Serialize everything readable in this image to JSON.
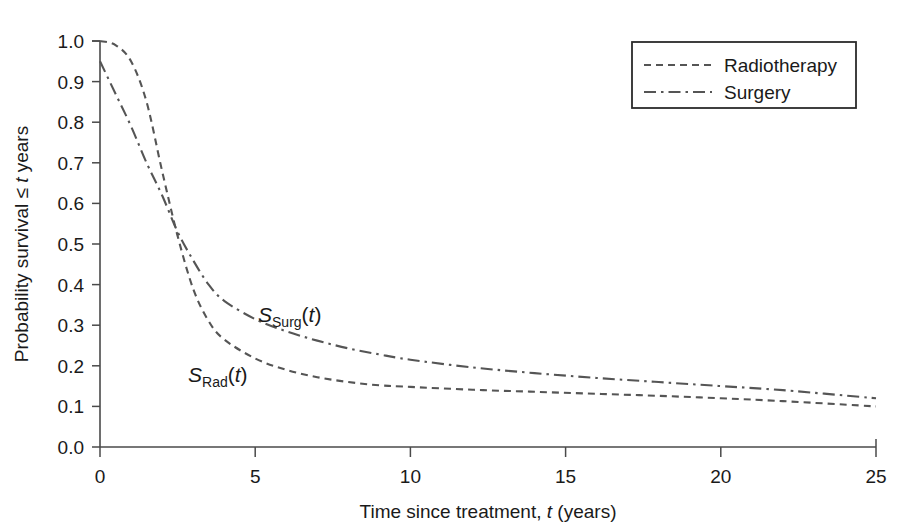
{
  "chart_data": {
    "type": "line",
    "title": "",
    "xlabel": "Time since treatment, t (years)",
    "ylabel": "Probability survival ≤ t years",
    "xlim": [
      0,
      25
    ],
    "ylim": [
      0,
      1
    ],
    "grid": false,
    "legend_position": "top-right",
    "x_ticks": [
      "0",
      "5",
      "10",
      "15",
      "20",
      "25"
    ],
    "x_tick_values": [
      0,
      5,
      10,
      15,
      20,
      25
    ],
    "y_ticks": [
      "0.0",
      "0.1",
      "0.2",
      "0.3",
      "0.4",
      "0.5",
      "0.6",
      "0.7",
      "0.8",
      "0.9",
      "1.0"
    ],
    "y_tick_values": [
      0.0,
      0.1,
      0.2,
      0.3,
      0.4,
      0.5,
      0.6,
      0.7,
      0.8,
      0.9,
      1.0
    ],
    "x": [
      0,
      0.5,
      1,
      1.5,
      2,
      2.5,
      3,
      3.5,
      4,
      5,
      6,
      7,
      8,
      9,
      10,
      12,
      14,
      16,
      18,
      20,
      22,
      25
    ],
    "series": [
      {
        "name": "Radiotherapy",
        "symbol": "S_Rad(t)",
        "linestyle": "dashed",
        "color": "#555555",
        "values": [
          1.0,
          0.99,
          0.95,
          0.85,
          0.68,
          0.52,
          0.39,
          0.31,
          0.265,
          0.218,
          0.19,
          0.172,
          0.16,
          0.152,
          0.148,
          0.141,
          0.136,
          0.131,
          0.126,
          0.12,
          0.113,
          0.1
        ]
      },
      {
        "name": "Surgery",
        "symbol": "S_Surg(t)",
        "linestyle": "dashdot",
        "color": "#555555",
        "values": [
          0.95,
          0.87,
          0.79,
          0.7,
          0.62,
          0.53,
          0.46,
          0.4,
          0.36,
          0.315,
          0.285,
          0.262,
          0.243,
          0.228,
          0.215,
          0.196,
          0.182,
          0.17,
          0.16,
          0.15,
          0.14,
          0.12
        ]
      }
    ],
    "annotations": [
      {
        "text": "S_Surg(t)",
        "x": 5.6,
        "y": 0.355
      },
      {
        "text": "S_Rad(t)",
        "x": 3.1,
        "y": 0.205
      }
    ]
  },
  "axes": {
    "y_title_main": "Probability survival ≤ ",
    "y_title_italic": "t",
    "y_title_tail": " years",
    "x_title_main": "Time since treatment, ",
    "x_title_italic": "t",
    "x_title_tail": " (years)"
  },
  "legend": {
    "items": [
      {
        "label": "Radiotherapy",
        "style": "dashed"
      },
      {
        "label": "Surgery",
        "style": "dashdot"
      }
    ]
  },
  "curve_labels": {
    "surgery": {
      "s": "S",
      "sub": "Surg",
      "arg_open": "(",
      "arg_italic": "t",
      "arg_close": ")"
    },
    "radiotherapy": {
      "s": "S",
      "sub": "Rad",
      "arg_open": "(",
      "arg_italic": "t",
      "arg_close": ")"
    }
  },
  "tick_text": {
    "y": [
      "1.0",
      "0.9",
      "0.8",
      "0.7",
      "0.6",
      "0.5",
      "0.4",
      "0.3",
      "0.2",
      "0.1",
      "0.0"
    ],
    "x": [
      "0",
      "5",
      "10",
      "15",
      "20",
      "25"
    ]
  }
}
